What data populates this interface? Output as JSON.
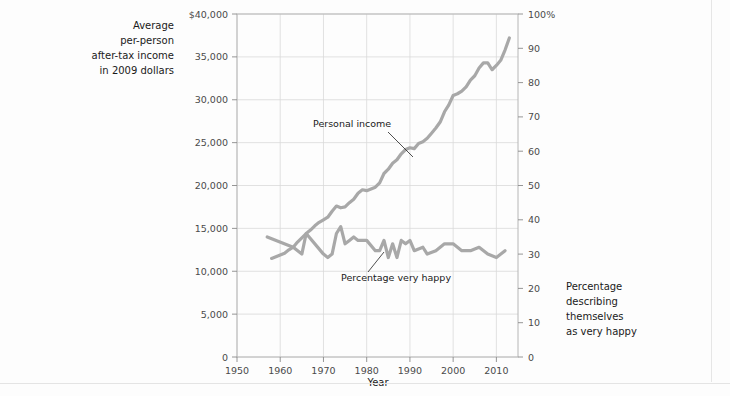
{
  "chart_data": {
    "type": "line",
    "title": "",
    "xlabel": "Year",
    "ylabel": "Average per-person after-tax income in 2009 dollars",
    "ylabel_right": "Percentage describing themselves as very happy",
    "xlim": [
      1950,
      2015
    ],
    "ylim": [
      0,
      40000
    ],
    "ylim_right": [
      0,
      100
    ],
    "grid": true,
    "legend": "annotations-on-plot",
    "x_ticks": [
      1950,
      1960,
      1970,
      1980,
      1990,
      2000,
      2010
    ],
    "x_tick_labels": [
      "1950",
      "1960",
      "1970",
      "1980",
      "1990",
      "2000",
      "2010"
    ],
    "y_ticks_left": [
      0,
      5000,
      10000,
      15000,
      20000,
      25000,
      30000,
      35000,
      40000
    ],
    "y_tick_labels_left": [
      "0",
      "5,000",
      "10,000",
      "15,000",
      "20,000",
      "25,000",
      "30,000",
      "35,000",
      "$40,000"
    ],
    "y_ticks_right": [
      0,
      10,
      20,
      30,
      40,
      50,
      60,
      70,
      80,
      90,
      100
    ],
    "y_tick_labels_right": [
      "0",
      "10",
      "20",
      "30",
      "40",
      "50",
      "60",
      "70",
      "80",
      "90",
      "100%"
    ],
    "series": [
      {
        "name": "Personal income",
        "axis": "left",
        "color": "#a8a8a8",
        "x": [
          1958,
          1959,
          1960,
          1961,
          1962,
          1963,
          1964,
          1965,
          1966,
          1967,
          1968,
          1969,
          1970,
          1971,
          1972,
          1973,
          1974,
          1975,
          1976,
          1977,
          1978,
          1979,
          1980,
          1981,
          1982,
          1983,
          1984,
          1985,
          1986,
          1987,
          1988,
          1989,
          1990,
          1991,
          1992,
          1993,
          1994,
          1995,
          1996,
          1997,
          1998,
          1999,
          2000,
          2001,
          2002,
          2003,
          2004,
          2005,
          2006,
          2007,
          2008,
          2009,
          2010,
          2011,
          2012,
          2013
        ],
        "values": [
          11500,
          11700,
          11900,
          12100,
          12500,
          12800,
          13400,
          13900,
          14400,
          14800,
          15300,
          15700,
          16000,
          16300,
          17000,
          17600,
          17400,
          17500,
          18000,
          18400,
          19100,
          19500,
          19400,
          19600,
          19800,
          20300,
          21400,
          21900,
          22600,
          23000,
          23700,
          24200,
          24400,
          24300,
          24900,
          25100,
          25500,
          26100,
          26700,
          27400,
          28600,
          29400,
          30500,
          30700,
          31000,
          31500,
          32300,
          32800,
          33700,
          34300,
          34300,
          33500,
          34000,
          34600,
          35800,
          37200
        ]
      },
      {
        "name": "Percentage very happy",
        "axis": "right",
        "color": "#a8a8a8",
        "x": [
          1957,
          1963,
          1965,
          1966,
          1970,
          1971,
          1972,
          1973,
          1974,
          1975,
          1976,
          1977,
          1978,
          1980,
          1982,
          1983,
          1984,
          1985,
          1986,
          1987,
          1988,
          1989,
          1990,
          1991,
          1993,
          1994,
          1996,
          1998,
          2000,
          2002,
          2004,
          2006,
          2008,
          2010,
          2012
        ],
        "values": [
          35,
          32,
          30,
          36,
          30,
          29,
          30,
          36,
          38,
          33,
          34,
          35,
          34,
          34,
          31,
          31,
          34,
          29,
          33,
          29,
          34,
          33,
          34,
          31,
          32,
          30,
          31,
          33,
          33,
          31,
          31,
          32,
          30,
          29,
          31
        ]
      }
    ],
    "annotations": [
      {
        "text": "Personal income",
        "label_x": 313,
        "label_y": 127,
        "leader_from": [
          388,
          132
        ],
        "leader_to": [
          413,
          157
        ]
      },
      {
        "text": "Percentage very happy",
        "label_x": 341,
        "label_y": 281,
        "leader_from": [
          368,
          272
        ],
        "leader_to": [
          384,
          252
        ]
      }
    ]
  },
  "labels": {
    "left_axis_title_lines": [
      "Average",
      "per-person",
      "after-tax income",
      "in 2009 dollars"
    ],
    "right_axis_title_lines": [
      "Percentage",
      "describing",
      "themselves",
      "as very happy"
    ],
    "x_axis_title": "Year"
  },
  "colors": {
    "series_gray": "#a8a8a8",
    "grid": "#d9d9d9",
    "frame": "#b6b6b6",
    "text": "#1a1a1a",
    "tick_text": "#4a4a4a",
    "background": "#fdfdfd"
  }
}
